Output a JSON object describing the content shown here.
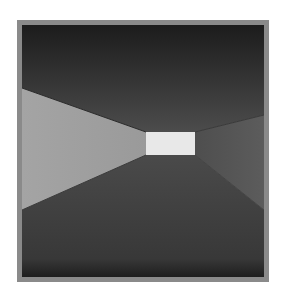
{
  "image": {
    "description": "Grayscale rendered corridor viewed in perspective with a bright rectangular opening at the vanishing point",
    "colors": {
      "frame": "#8a8a8a",
      "ceiling_top": "#1e1e1e",
      "ceiling_bottom": "#4a4a4a",
      "left_wall": "#a8a8a8",
      "right_wall": "#555555",
      "floor_top": "#4a4a4a",
      "floor_bottom": "#252525",
      "opening": "#e6e6e6"
    }
  }
}
